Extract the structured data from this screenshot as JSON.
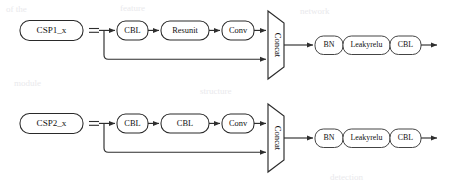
{
  "figure": {
    "type": "block-diagram",
    "background_color": "#ffffff",
    "line_color": "#2e2e2e",
    "node_fill_color": "#ffffff",
    "node_border_color": "#2a2a2a",
    "text_color": "#111111"
  },
  "rows": [
    {
      "id": "csp1",
      "input_label": "CSP1_x",
      "equals_symbol": "=",
      "main_path": [
        "CBL",
        "Resunit",
        "Conv"
      ],
      "skip_path_label": "",
      "merge": "Concat",
      "post_merge": [
        "BN",
        "Leakyrelu",
        "CBL"
      ]
    },
    {
      "id": "csp2",
      "input_label": "CSP2_x",
      "equals_symbol": "=",
      "main_path": [
        "CBL",
        "CBL",
        "Conv"
      ],
      "skip_path_label": "",
      "merge": "Concat",
      "post_merge": [
        "BN",
        "Leakyrelu",
        "CBL"
      ]
    }
  ],
  "icons": {
    "arrow": "arrowhead-right-icon",
    "branch": "branch-split-icon"
  },
  "bleed_through": [
    "of the",
    "feature",
    "network",
    "module",
    "structure",
    "detection"
  ]
}
